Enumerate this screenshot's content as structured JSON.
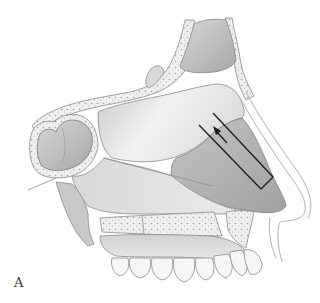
{
  "figure": {
    "panel_label": "A",
    "annotation": {
      "type": "incision-marker",
      "description": "Parallel dashed incision lines on septal cartilage with directional arrow pointing posterior-superior",
      "line_color": "#1a1a1a"
    },
    "regions": [
      {
        "name": "frontal-sinus"
      },
      {
        "name": "sphenoid-sinus"
      },
      {
        "name": "perpendicular-plate-ethmoid"
      },
      {
        "name": "septal-cartilage"
      },
      {
        "name": "vomer"
      },
      {
        "name": "maxillary-crest"
      },
      {
        "name": "nasal-spine"
      },
      {
        "name": "hard-palate"
      },
      {
        "name": "upper-teeth"
      },
      {
        "name": "nasal-tip"
      }
    ],
    "colors": {
      "background": "#ffffff",
      "bone_light": "#ececec",
      "mid_gray": "#cfcfcf",
      "cartilage_gray": "#b5b5b5",
      "dark_gray": "#9a9a9a",
      "outline": "#7a7a7a"
    }
  }
}
